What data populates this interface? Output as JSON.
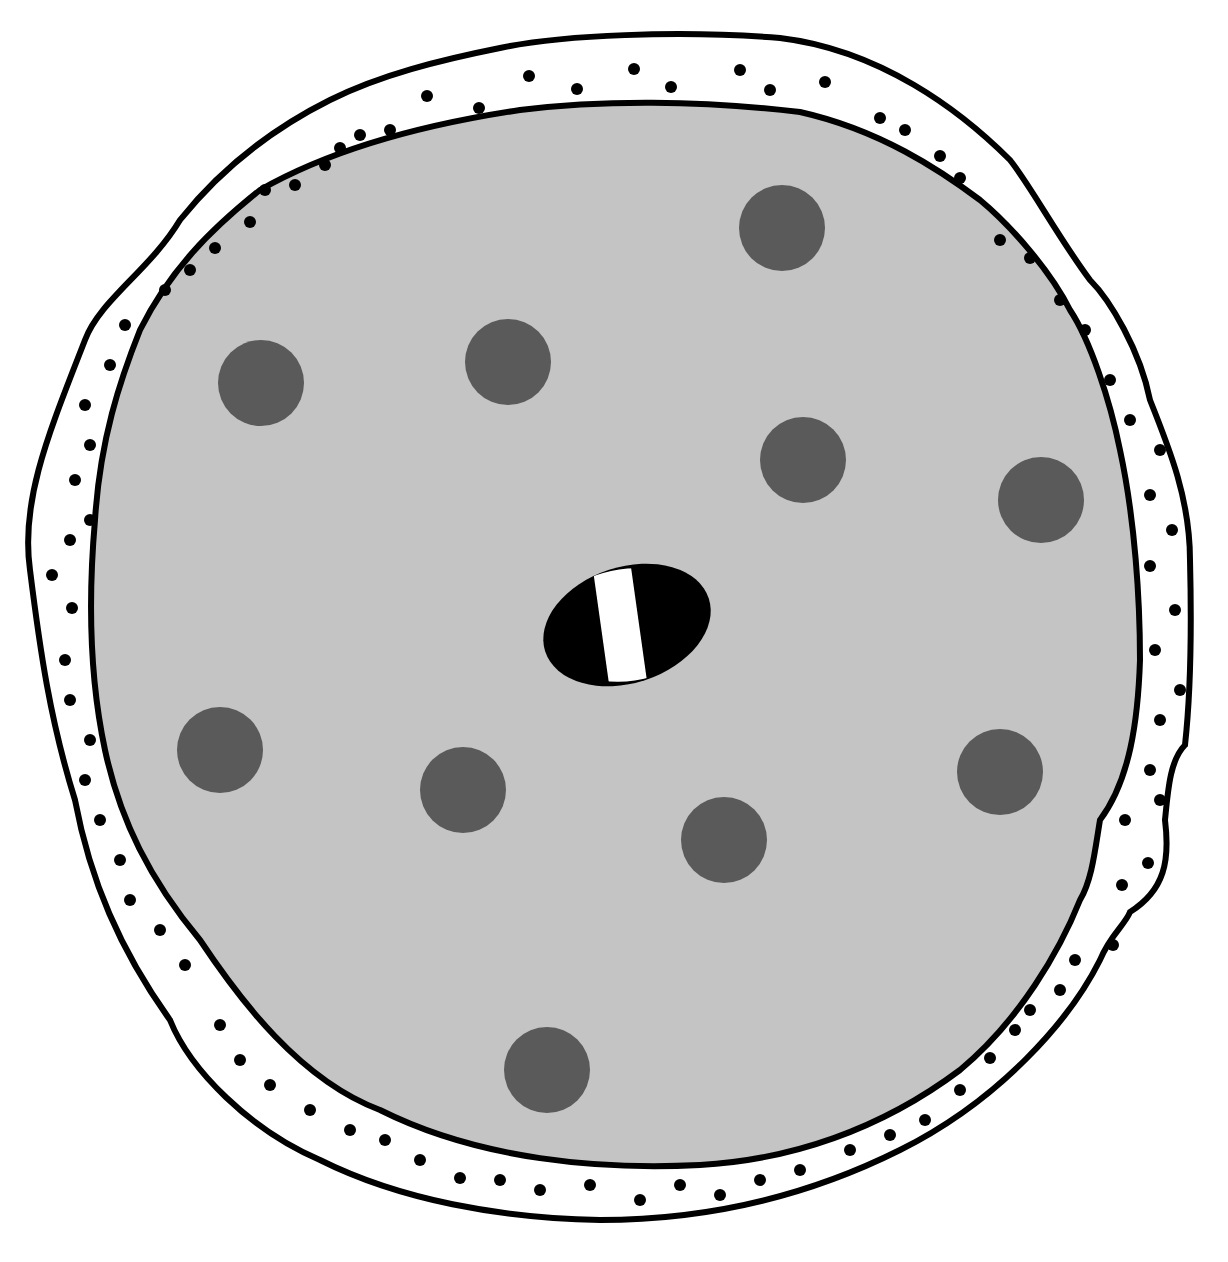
{
  "diagram": {
    "colors": {
      "background": "#ffffff",
      "outline": "#000000",
      "interior": "#c4c4c4",
      "granule": "#5a5a5a",
      "dot": "#000000",
      "central_body_outer": "#000000",
      "central_body_band": "#ffffff"
    },
    "granules": [
      {
        "cx": 782,
        "cy": 228,
        "r": 43
      },
      {
        "cx": 261,
        "cy": 383,
        "r": 43
      },
      {
        "cx": 508,
        "cy": 362,
        "r": 43
      },
      {
        "cx": 803,
        "cy": 460,
        "r": 43
      },
      {
        "cx": 1041,
        "cy": 500,
        "r": 43
      },
      {
        "cx": 220,
        "cy": 750,
        "r": 43
      },
      {
        "cx": 463,
        "cy": 790,
        "r": 43
      },
      {
        "cx": 724,
        "cy": 840,
        "r": 43
      },
      {
        "cx": 1000,
        "cy": 772,
        "r": 43
      },
      {
        "cx": 547,
        "cy": 1070,
        "r": 43
      }
    ],
    "central_body": {
      "cx": 627,
      "cy": 625,
      "rx": 86,
      "ry": 58,
      "rotate": -18
    }
  }
}
